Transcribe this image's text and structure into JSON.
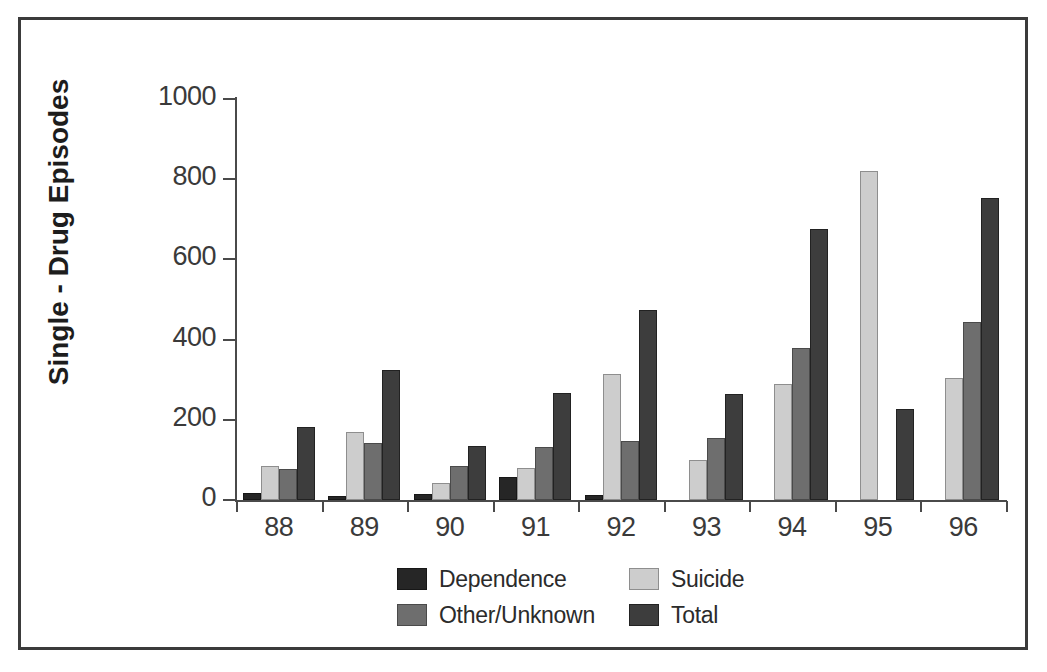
{
  "chart_data": {
    "type": "bar",
    "title": "",
    "xlabel": "",
    "ylabel": "Single - Drug Episodes",
    "categories": [
      "88",
      "89",
      "90",
      "91",
      "92",
      "93",
      "94",
      "95",
      "96"
    ],
    "ylim": [
      0,
      1000
    ],
    "yticks": [
      0,
      200,
      400,
      600,
      800,
      1000
    ],
    "ytick_labels": [
      "0",
      "200",
      "400",
      "600",
      "800",
      "1000"
    ],
    "grid": false,
    "legend_position": "bottom",
    "series": [
      {
        "name": "Dependence",
        "color": "#262626",
        "values": [
          17,
          11,
          15,
          57,
          13,
          0,
          0,
          0,
          0
        ]
      },
      {
        "name": "Suicide",
        "color": "#cdcdcd",
        "values": [
          85,
          170,
          42,
          80,
          315,
          100,
          290,
          820,
          305
        ]
      },
      {
        "name": "Other/Unknown",
        "color": "#6e6e6e",
        "values": [
          78,
          142,
          85,
          133,
          146,
          155,
          378,
          0,
          443
        ]
      },
      {
        "name": "Total",
        "color": "#3d3d3d",
        "values": [
          182,
          325,
          135,
          268,
          474,
          264,
          675,
          228,
          753
        ]
      }
    ]
  },
  "legend": {
    "entries": [
      {
        "label": "Dependence",
        "key": "dependence"
      },
      {
        "label": "Suicide",
        "key": "suicide"
      },
      {
        "label": "Other/Unknown",
        "key": "other"
      },
      {
        "label": "Total",
        "key": "total"
      }
    ]
  },
  "colors": {
    "frame": "#3b3b3b",
    "axis": "#4a4a4a",
    "text": "#2b2b2b",
    "background": "#ffffff"
  }
}
